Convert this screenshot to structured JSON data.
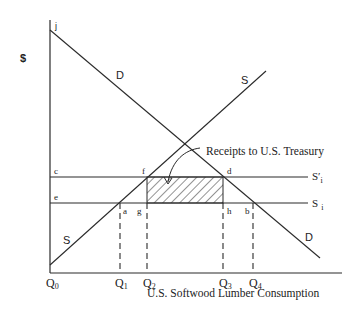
{
  "diagram": {
    "y_axis_label": "$",
    "x_axis_label": "U.S. Softwood Lumber Consumption",
    "annotation": "Receipts to U.S. Treasury",
    "curves": {
      "demand_top_label": "D",
      "demand_bottom_label": "D",
      "supply_top_label": "S",
      "supply_bottom_label": "S",
      "import_supply_with_tax": "S′",
      "import_supply_with_tax_sub": "i",
      "import_supply": "S",
      "import_supply_sub": "i"
    },
    "points": {
      "j": "j",
      "c": "c",
      "e": "e",
      "f": "f",
      "d": "d",
      "a": "a",
      "g": "g",
      "h": "h",
      "b": "b"
    },
    "quantities": {
      "q0": "Q",
      "q0_sub": "0",
      "q1": "Q",
      "q1_sub": "1",
      "q2": "Q",
      "q2_sub": "2",
      "q3": "Q",
      "q3_sub": "3",
      "q4": "Q",
      "q4_sub": "4"
    },
    "colors": {
      "line": "#2a2a2a",
      "background": "#ffffff"
    }
  }
}
